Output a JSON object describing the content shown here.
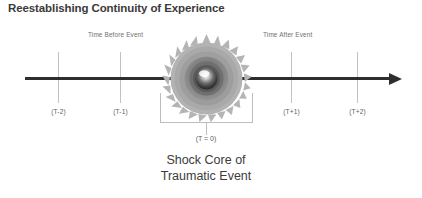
{
  "figure": {
    "title": "Reestablishing Continuity of Experience",
    "caption_line_1": "Shock Core of",
    "caption_line_2": "Traumatic Event",
    "center_time_label": "(T = 0)",
    "phase_before_label": "Time Before Event",
    "phase_after_label": "Time After Event",
    "axis_color": "#2e2e2e",
    "tick_color": "#c2c2c2",
    "bracket_color": "#bdbdbd",
    "text_color": "#3b3b3b",
    "burst_color": "#9a9a9a",
    "background_color": "#ffffff"
  },
  "chart_data": {
    "type": "line",
    "title": "Reestablishing Continuity of Experience",
    "xlabel": "",
    "ylabel": "",
    "grid": false,
    "legend": "none",
    "axis_direction": "left-to-right arrow",
    "categories": [
      "(T-2)",
      "(T-1)",
      "(T = 0)",
      "(T+1)",
      "(T+2)"
    ],
    "x": [
      -2,
      -1,
      0,
      1,
      2
    ],
    "tick_labels": [
      "(T-2)",
      "(T-1)",
      "(T+1)",
      "(T+2)"
    ],
    "tick_positions_px": [
      58,
      120,
      291,
      357
    ],
    "annotations": [
      {
        "text": "Time Before Event",
        "x": -1.5,
        "position": "above-axis-left"
      },
      {
        "text": "Time After Event",
        "x": 1.5,
        "position": "above-axis-right"
      },
      {
        "text": "Shock Core of Traumatic Event",
        "x": 0,
        "position": "below-axis-center"
      },
      {
        "text": "(T = 0)",
        "x": 0,
        "position": "below-axis-center-bracket"
      }
    ],
    "event_marker": {
      "label": "Shock Core of Traumatic Event",
      "x": 0,
      "shape": "radial-burst-sphere"
    }
  },
  "ticks": [
    {
      "label": "(T-2)",
      "left": 58
    },
    {
      "label": "(T-1)",
      "left": 120
    },
    {
      "label": "(T+1)",
      "left": 291
    },
    {
      "label": "(T+2)",
      "left": 357
    }
  ]
}
